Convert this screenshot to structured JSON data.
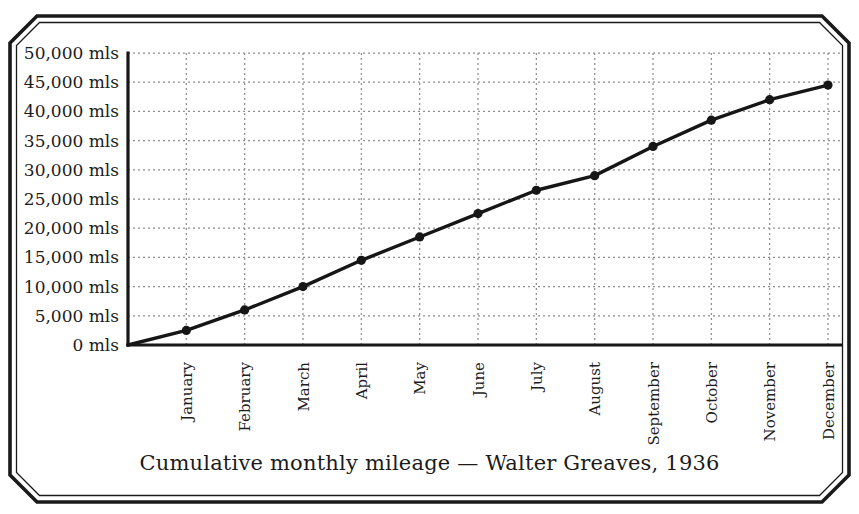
{
  "chart_data": {
    "type": "line",
    "title": "Cumulative monthly mileage — Walter Greaves, 1936",
    "categories": [
      "January",
      "February",
      "March",
      "April",
      "May",
      "June",
      "July",
      "August",
      "September",
      "October",
      "November",
      "December"
    ],
    "values": [
      2500,
      6000,
      10000,
      14500,
      18500,
      22500,
      26500,
      29000,
      34000,
      38500,
      42000,
      44500
    ],
    "unit_suffix": "mls",
    "ylim": [
      0,
      50000
    ],
    "y_tick_step": 5000,
    "y_tick_values": [
      50000,
      45000,
      40000,
      35000,
      30000,
      25000,
      20000,
      15000,
      10000,
      5000,
      0
    ],
    "y_tick_labels": [
      "50,000 mls",
      "45,000 mls",
      "40,000 mls",
      "35,000 mls",
      "30,000 mls",
      "25,000 mls",
      "20,000 mls",
      "15,000 mls",
      "10,000 mls",
      "5,000 mls",
      "0 mls"
    ],
    "line_starts_at_origin": true,
    "grid": "dotted",
    "legend": "none",
    "marker": "circle",
    "line_color": "#161616",
    "grid_color": "#8f8f8f"
  }
}
